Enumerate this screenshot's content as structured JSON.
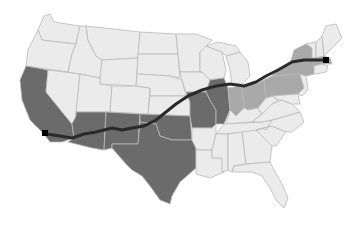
{
  "map": {
    "title": "",
    "colors": {
      "background": "#ffffff",
      "state_default": "#ebebeb",
      "state_border": "#b9b9b9",
      "route_primary_states": "#6b6b6b",
      "route_secondary_states": "#a9a9a9",
      "route_line": "#2a2a2a",
      "endpoint": "#000000"
    },
    "route": {
      "start": "Los Angeles, CA",
      "end": "Boston, MA",
      "primary_states": [
        "California",
        "Arizona",
        "New Mexico",
        "Texas",
        "Oklahoma",
        "Missouri",
        "Illinois"
      ],
      "secondary_states": [
        "Indiana",
        "Ohio",
        "Pennsylvania",
        "New York",
        "Massachusetts"
      ]
    }
  }
}
